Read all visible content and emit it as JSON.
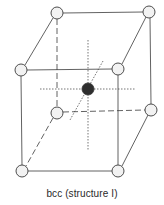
{
  "caption": "bcc (structure I)",
  "colors": {
    "line": "#3a3a3a",
    "atom_stroke": "#3a3a3a",
    "atom_fill": "#f2f2f2",
    "center_atom_fill": "#2e2e2e"
  },
  "atoms": {
    "corner": [
      {
        "id": "back-top-left",
        "x": 57,
        "y": 13
      },
      {
        "id": "back-top-right",
        "x": 149,
        "y": 12
      },
      {
        "id": "front-top-left",
        "x": 21,
        "y": 70
      },
      {
        "id": "front-top-right",
        "x": 118,
        "y": 69
      },
      {
        "id": "back-bottom-left",
        "x": 57,
        "y": 113
      },
      {
        "id": "back-bottom-right",
        "x": 151,
        "y": 110
      },
      {
        "id": "front-bottom-left",
        "x": 22,
        "y": 171
      },
      {
        "id": "front-bottom-right",
        "x": 118,
        "y": 171
      }
    ],
    "body_center": {
      "id": "body-center",
      "x": 88,
      "y": 89
    }
  }
}
